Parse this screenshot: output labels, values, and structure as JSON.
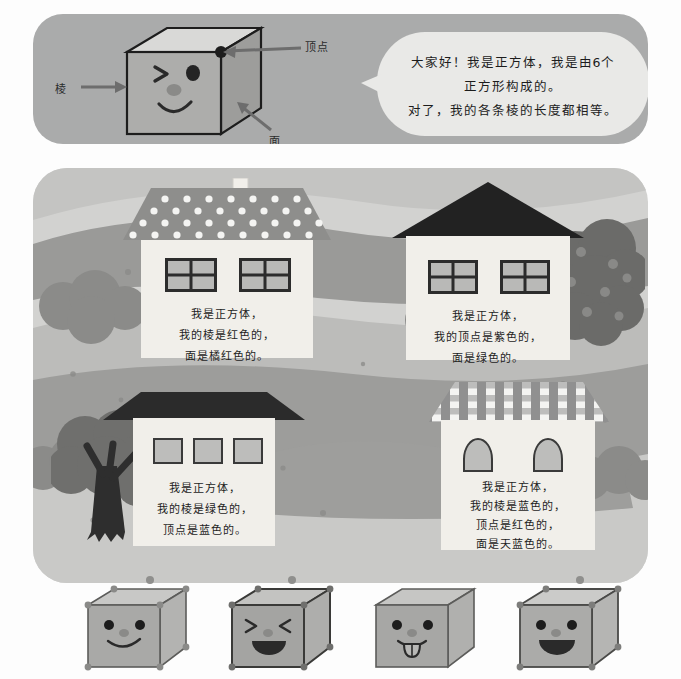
{
  "top_panel": {
    "labels": {
      "vertex": "顶点",
      "edge": "棱",
      "face": "面"
    },
    "speech_bubble": {
      "line1": "大家好！我是正方体，我是由6个",
      "line2": "正方形构成的。",
      "line3": "对了，我的各条棱的长度都相等。"
    }
  },
  "scene": {
    "houses": [
      {
        "id": "house-1",
        "roof_style": "polka-dot",
        "windows": 2,
        "lines": [
          "我是正方体，",
          "我的棱是红色的，",
          "面是橘红色的。"
        ]
      },
      {
        "id": "house-2",
        "roof_style": "dark-triangle",
        "windows": 2,
        "lines": [
          "我是正方体，",
          "我的顶点是紫色的，",
          "面是绿色的。"
        ]
      },
      {
        "id": "house-3",
        "roof_style": "flat-dark",
        "windows": 3,
        "lines": [
          "我是正方体，",
          "我的棱是绿色的，",
          "顶点是蓝色的。"
        ]
      },
      {
        "id": "house-4",
        "roof_style": "checkered",
        "windows": 2,
        "lines": [
          "我是正方体，",
          "我的棱是蓝色的，",
          "顶点是红色的，",
          "面是天蓝色的。"
        ]
      }
    ]
  },
  "bottom_cubes": [
    {
      "id": "cube-1",
      "expression": "smile-two-eyes"
    },
    {
      "id": "cube-2",
      "expression": "squint-laugh"
    },
    {
      "id": "cube-3",
      "expression": "tongue-out"
    },
    {
      "id": "cube-4",
      "expression": "big-open-smile"
    }
  ],
  "colors": {
    "panel_top_bg": "#aaabab",
    "scene_bg": "#d2d2d0",
    "bubble_bg": "#e9e9e7",
    "house_wall": "#f1efea",
    "ink": "#1c1c1c",
    "cube_face": "#a9a9a7",
    "cube_top": "#c8c8c6",
    "cube_side": "#b8b8b6"
  }
}
